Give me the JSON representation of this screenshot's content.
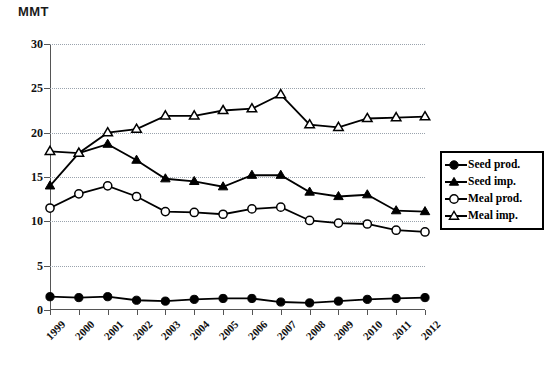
{
  "chart_data": {
    "type": "line",
    "title": "",
    "xlabel": "",
    "ylabel": "MMT",
    "unit_label": "MMT",
    "ylim": [
      0,
      30
    ],
    "yticks": [
      0,
      5,
      10,
      15,
      20,
      25,
      30
    ],
    "grid": true,
    "legend_position": "right",
    "categories": [
      "1999",
      "2000",
      "2001",
      "2002",
      "2003",
      "2004",
      "2005",
      "2006",
      "2007",
      "2008",
      "2009",
      "2010",
      "2011",
      "2012"
    ],
    "series": [
      {
        "name": "Seed prod.",
        "marker": "filled-circle",
        "values": [
          1.5,
          1.4,
          1.5,
          1.1,
          1.0,
          1.2,
          1.3,
          1.3,
          0.9,
          0.8,
          1.0,
          1.2,
          1.3,
          1.4
        ]
      },
      {
        "name": "Seed imp.",
        "marker": "filled-triangle",
        "values": [
          14.0,
          17.7,
          18.7,
          16.9,
          14.8,
          14.5,
          13.9,
          15.2,
          15.2,
          13.3,
          12.8,
          13.0,
          11.2,
          11.1
        ]
      },
      {
        "name": "Meal prod.",
        "marker": "open-circle",
        "values": [
          11.5,
          13.1,
          14.0,
          12.8,
          11.1,
          11.0,
          10.8,
          11.4,
          11.6,
          10.1,
          9.8,
          9.7,
          9.0,
          8.8
        ]
      },
      {
        "name": "Meal imp.",
        "marker": "open-triangle",
        "values": [
          17.9,
          17.7,
          20.0,
          20.4,
          21.9,
          21.9,
          22.5,
          22.7,
          24.3,
          20.9,
          20.6,
          21.6,
          21.7,
          21.8
        ]
      }
    ]
  },
  "legend": {
    "items": [
      {
        "label": "Seed prod."
      },
      {
        "label": "Seed imp."
      },
      {
        "label": "Meal prod."
      },
      {
        "label": "Meal imp."
      }
    ]
  }
}
